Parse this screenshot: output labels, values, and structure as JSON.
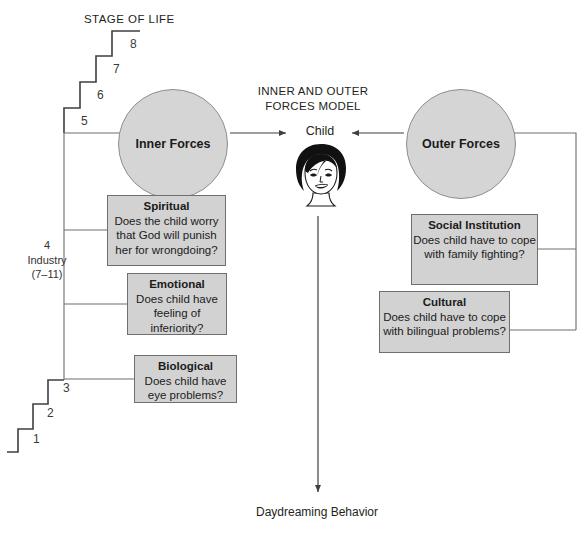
{
  "diagram": {
    "stage_heading": "STAGE OF LIFE",
    "model_title": "INNER AND OUTER\nFORCES MODEL",
    "stage_numbers": [
      "1",
      "2",
      "3",
      "4",
      "5",
      "6",
      "7",
      "8"
    ],
    "industry_label": "4\nIndustry\n(7–11)",
    "inner_forces": "Inner Forces",
    "outer_forces": "Outer Forces",
    "child": "Child",
    "child_icon": "child-face-illustration",
    "outcome": "Daydreaming Behavior"
  },
  "inner_boxes": [
    {
      "id": "spiritual",
      "title": "Spiritual",
      "body": "Does the child worry that God will punish her for wrongdoing?"
    },
    {
      "id": "emotional",
      "title": "Emotional",
      "body": "Does child have feeling of inferiority?"
    },
    {
      "id": "biological",
      "title": "Biological",
      "body": "Does child have eye problems?"
    }
  ],
  "outer_boxes": [
    {
      "id": "social",
      "title": "Social Institution",
      "body": "Does child have to cope with family fighting?"
    },
    {
      "id": "cultural",
      "title": "Cultural",
      "body": "Does child have to cope with bilingual problems?"
    }
  ],
  "colors": {
    "shape_fill": "#d2d2d2",
    "circle_fill": "#d5d5d5",
    "stroke": "#6f6f6f",
    "line": "#58595b",
    "text": "#231f20",
    "background": "#ffffff"
  },
  "step_positions": [
    {
      "n": "1",
      "x": 33,
      "y": 432
    },
    {
      "n": "2",
      "x": 47,
      "y": 406
    },
    {
      "n": "3",
      "x": 63,
      "y": 381
    },
    {
      "n": "5",
      "x": 81,
      "y": 114
    },
    {
      "n": "6",
      "x": 97,
      "y": 88
    },
    {
      "n": "7",
      "x": 113,
      "y": 62
    },
    {
      "n": "8",
      "x": 130,
      "y": 37
    }
  ]
}
